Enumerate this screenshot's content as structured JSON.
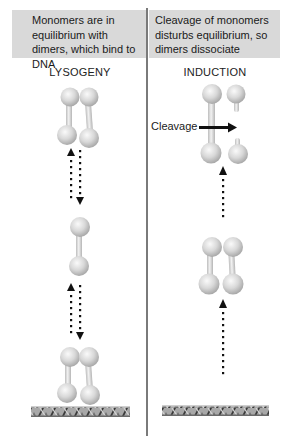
{
  "panels": {
    "left": {
      "header": "Monomers are in equilibrium with dimers, which bind to DNA",
      "title": "LYSOGENY"
    },
    "right": {
      "header": "Cleavage of monomers disturbs equilibrium, so dimers dissociate",
      "title": "INDUCTION",
      "annotation": "Cleavage"
    }
  },
  "colors": {
    "header_background": "#d9d9d9",
    "divider": "#7a7a7a",
    "protein": "#d6d6d6",
    "arrow": "#111111",
    "dna": "#8a8a8a"
  },
  "elements": {
    "left": [
      "dimer",
      "reversible-arrow",
      "monomer",
      "reversible-arrow",
      "dimer-bound-to-dna",
      "dna"
    ],
    "right": [
      "dimer-cleaved",
      "cleavage-arrow",
      "up-arrow",
      "dimer",
      "up-arrow",
      "dna"
    ]
  }
}
